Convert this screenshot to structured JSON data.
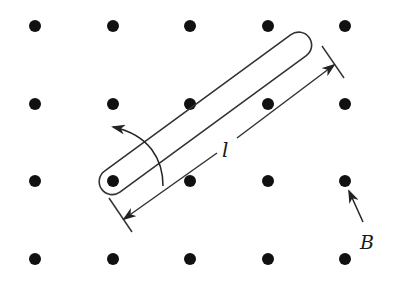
{
  "figure": {
    "labels": {
      "length": "l",
      "field": "B"
    },
    "field_direction": "out-of-page",
    "dot_grid": {
      "columns_x": [
        35,
        113,
        190,
        268,
        345
      ],
      "rows_y": [
        26,
        104,
        181,
        259
      ],
      "dot_radius": 6,
      "color": "#111111"
    },
    "rod": {
      "pivot": [
        113,
        181
      ],
      "end": [
        300,
        44
      ],
      "half_width": 13,
      "stroke": "#333333"
    },
    "rotation_arrow": "counterclockwise",
    "colors": {
      "background": "#ffffff",
      "ink": "#111111",
      "line": "#333333"
    }
  }
}
